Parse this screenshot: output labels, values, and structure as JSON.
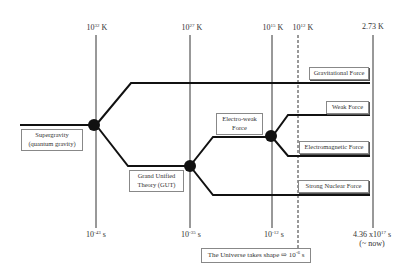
{
  "temperatures": [
    {
      "base": "10",
      "exp": "32",
      "unit": " K"
    },
    {
      "base": "10",
      "exp": "27",
      "unit": " K"
    },
    {
      "base": "10",
      "exp": "15",
      "unit": " K"
    },
    {
      "base": "10",
      "exp": "12",
      "unit": " K"
    },
    {
      "base": "2.73",
      "exp": "",
      "unit": " K"
    }
  ],
  "times": [
    {
      "base": "10",
      "exp": "-43",
      "unit": " s",
      "note": ""
    },
    {
      "base": "10",
      "exp": "-35",
      "unit": " s",
      "note": ""
    },
    {
      "base": "10",
      "exp": "-12",
      "unit": " s",
      "note": ""
    },
    {
      "base": "4.36 x10",
      "exp": "17",
      "unit": " s",
      "note": "(~ now)"
    }
  ],
  "nodes": {
    "supergravity": {
      "line1": "Supergravity",
      "line2": "(quantum gravity)"
    },
    "gut": {
      "line1": "Grand Unified",
      "line2": "Theory (GUT)"
    },
    "electroweak": {
      "line1": "Electro-weak",
      "line2": "Force"
    }
  },
  "forces": {
    "gravitational": "Gravitational Force",
    "weak": "Weak Force",
    "electromagnetic": "Electromagnetic Force",
    "strong": "Strong Nuclear Force"
  },
  "universe_shape": {
    "text": "The Universe takes shape ⇨ 10",
    "exp": "-6",
    "unit": " s"
  },
  "colors": {
    "line": "#111111",
    "box_border": "#888888",
    "background": "#ffffff"
  }
}
